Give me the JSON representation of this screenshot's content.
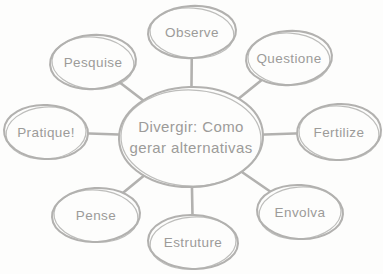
{
  "colors": {
    "background": "#fdfdfc",
    "stroke": "#b2b1af",
    "text": "#9c9b99"
  },
  "diagram": {
    "type": "mind-map",
    "center": {
      "label_lines": [
        "Divergir: Como",
        "gerar alternativas"
      ]
    },
    "nodes": [
      {
        "label": "Observe"
      },
      {
        "label": "Questione"
      },
      {
        "label": "Fertilize"
      },
      {
        "label": "Envolva"
      },
      {
        "label": "Estruture"
      },
      {
        "label": "Pense"
      },
      {
        "label": "Pratique!"
      },
      {
        "label": "Pesquise"
      }
    ]
  }
}
